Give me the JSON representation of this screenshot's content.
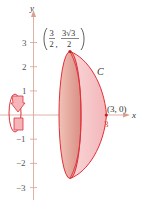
{
  "figure": {
    "axes": {
      "x_label": "x",
      "y_label": "y",
      "y_ticks": [
        {
          "value": 3,
          "label": "3"
        },
        {
          "value": 2,
          "label": "2"
        },
        {
          "value": 1,
          "label": "1"
        },
        {
          "value": -1,
          "label": "−1"
        },
        {
          "value": -2,
          "label": "−2"
        },
        {
          "value": -3,
          "label": "−3"
        }
      ],
      "x_ticks": [
        {
          "value": 3,
          "label": "3"
        }
      ]
    },
    "curve_label": "C",
    "points": {
      "top": {
        "x_num": "3",
        "x_den": "2",
        "y_num": "3√3",
        "y_den": "2"
      },
      "end": {
        "label": "(3, 0)"
      }
    },
    "colors": {
      "axis": "#d9a090",
      "curve": "#e0303a",
      "fill_light": "#f7c9c9",
      "fill_dark": "#e4a9a0",
      "tick_label_x3": "#d44a2a"
    },
    "icons": {
      "rotation": "rotation-about-x-axis-icon"
    }
  }
}
